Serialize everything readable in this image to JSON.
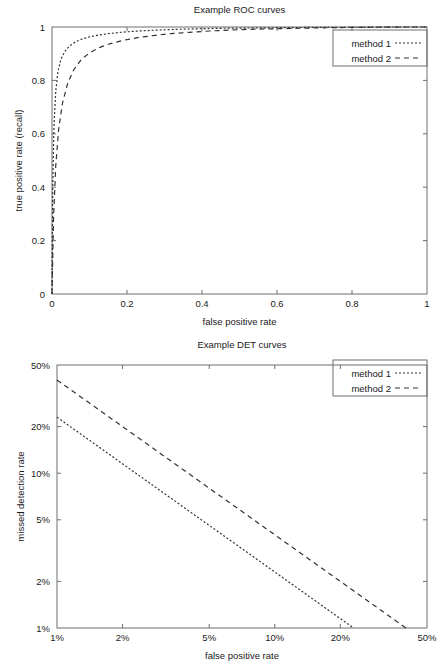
{
  "chart_data": [
    {
      "id": "roc",
      "type": "line",
      "title": "Example ROC curves",
      "xlabel": "false positive rate",
      "ylabel": "true positive rate (recall)",
      "xscale": "linear",
      "yscale": "linear",
      "xlim": [
        0,
        1
      ],
      "ylim": [
        0,
        1
      ],
      "grid": false,
      "legend_position": "top-right",
      "xticks": [
        0,
        0.2,
        0.4,
        0.6,
        0.8,
        1
      ],
      "xticklabels": [
        "0",
        "0.2",
        "0.4",
        "0.6",
        "0.8",
        "1"
      ],
      "yticks": [
        0,
        0.2,
        0.4,
        0.6,
        0.8,
        1
      ],
      "yticklabels": [
        "0",
        "0.2",
        "0.4",
        "0.6",
        "0.8",
        "1"
      ],
      "series": [
        {
          "name": "method 1",
          "style": "dotted",
          "dash": "2,2",
          "x": [
            0.0,
            0.002,
            0.005,
            0.01,
            0.016,
            0.024,
            0.034,
            0.046,
            0.062,
            0.08,
            0.1,
            0.125,
            0.155,
            0.19,
            0.23,
            0.275,
            0.325,
            0.38,
            0.44,
            0.505,
            0.575,
            0.65,
            0.73,
            0.815,
            0.905,
            1.0
          ],
          "y": [
            0.0,
            0.4,
            0.62,
            0.76,
            0.835,
            0.88,
            0.908,
            0.928,
            0.944,
            0.955,
            0.963,
            0.97,
            0.976,
            0.981,
            0.985,
            0.988,
            0.991,
            0.993,
            0.995,
            0.996,
            0.997,
            0.998,
            0.999,
            0.999,
            1.0,
            1.0
          ]
        },
        {
          "name": "method 2",
          "style": "dashed",
          "dash": "5,4",
          "x": [
            0.0,
            0.004,
            0.01,
            0.018,
            0.028,
            0.042,
            0.058,
            0.078,
            0.1,
            0.126,
            0.156,
            0.19,
            0.228,
            0.27,
            0.316,
            0.366,
            0.42,
            0.48,
            0.545,
            0.615,
            0.69,
            0.77,
            0.855,
            0.945,
            1.0
          ],
          "y": [
            0.0,
            0.28,
            0.48,
            0.62,
            0.715,
            0.79,
            0.84,
            0.878,
            0.903,
            0.923,
            0.938,
            0.95,
            0.96,
            0.968,
            0.975,
            0.98,
            0.985,
            0.989,
            0.992,
            0.994,
            0.996,
            0.998,
            0.999,
            1.0,
            1.0
          ]
        }
      ]
    },
    {
      "id": "det",
      "type": "line",
      "title": "Example DET curves",
      "xlabel": "false positive rate",
      "ylabel": "missed detection rate",
      "xscale": "log",
      "yscale": "log",
      "xlim": [
        1,
        50
      ],
      "ylim": [
        1,
        50
      ],
      "grid": false,
      "legend_position": "top-right",
      "xticks": [
        1,
        2,
        5,
        10,
        20,
        50
      ],
      "xticklabels": [
        "1%",
        "2%",
        "5%",
        "10%",
        "20%",
        "50%"
      ],
      "yticks": [
        1,
        2,
        5,
        10,
        20,
        50
      ],
      "yticklabels": [
        "1%",
        "2%",
        "5%",
        "10%",
        "20%",
        "50%"
      ],
      "series": [
        {
          "name": "method 1",
          "style": "dotted",
          "dash": "2,2",
          "x": [
            1,
            23
          ],
          "y": [
            23,
            1
          ]
        },
        {
          "name": "method 2",
          "style": "dashed",
          "dash": "5,4",
          "x": [
            1,
            40
          ],
          "y": [
            40,
            1
          ]
        }
      ]
    }
  ],
  "roc": {
    "title": "Example ROC curves",
    "xlabel": "false positive rate",
    "ylabel": "true positive rate (recall)",
    "legend": [
      {
        "label": "method 1"
      },
      {
        "label": "method 2"
      }
    ]
  },
  "det": {
    "title": "Example DET curves",
    "xlabel": "false positive rate",
    "ylabel": "missed detection rate",
    "legend": [
      {
        "label": "method 1"
      },
      {
        "label": "method 2"
      }
    ]
  },
  "colors": {
    "axis": "#6e6e6e",
    "text": "#1a1a1a",
    "curve": "#333333",
    "background": "#ffffff"
  }
}
